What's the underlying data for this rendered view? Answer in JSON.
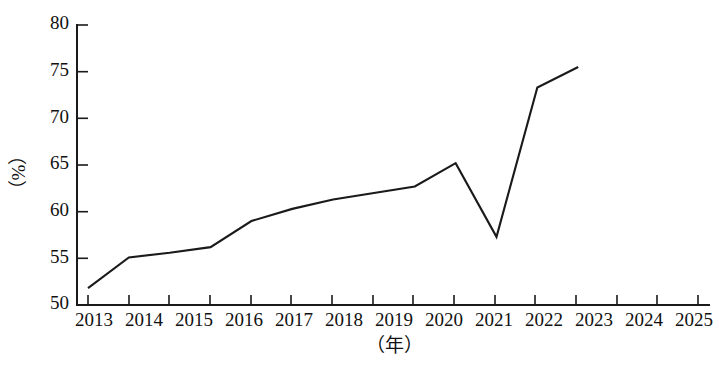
{
  "chart_data": {
    "type": "line",
    "title": "",
    "subtitle": "",
    "xlabel": "（年）",
    "ylabel": "（%）",
    "categories": [
      "2013",
      "2014",
      "2015",
      "2016",
      "2017",
      "2018",
      "2019",
      "2020",
      "2021",
      "2022",
      "2023",
      "2024",
      "2025"
    ],
    "x": [
      2013,
      2014,
      2015,
      2016,
      2017,
      2018,
      2019,
      2020,
      2021,
      2022,
      2023,
      2024,
      2025
    ],
    "values": [
      51.8,
      55.1,
      55.6,
      56.2,
      59.0,
      60.3,
      61.3,
      62.0,
      62.7,
      65.2,
      57.3,
      73.3,
      75.5
    ],
    "series": [
      {
        "name": "",
        "values": [
          51.8,
          55.1,
          55.6,
          56.2,
          59.0,
          60.3,
          61.3,
          62.0,
          62.7,
          65.2,
          57.3,
          73.3,
          75.5
        ]
      }
    ],
    "ylim": [
      50,
      80
    ],
    "yticks": [
      50,
      55,
      60,
      65,
      70,
      75,
      80
    ],
    "ytick_labels": [
      "50",
      "55",
      "60",
      "65",
      "70",
      "75",
      "80"
    ],
    "xtick_labels": [
      "2013",
      "2014",
      "2015",
      "2016",
      "2017",
      "2018",
      "2019",
      "2020",
      "2021",
      "2022",
      "2023",
      "2024",
      "2025"
    ],
    "grid": false,
    "legend": false,
    "legend_position": "none",
    "line_color": "#1a1a1a",
    "background_color": "#ffffff",
    "markers": false
  },
  "axes": {
    "y_axis_label": "（%）",
    "x_axis_label": "（年）"
  }
}
